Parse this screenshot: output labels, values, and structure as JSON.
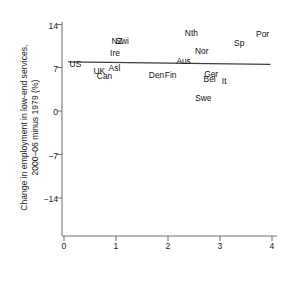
{
  "chart_data": {
    "type": "scatter",
    "title": "",
    "xlabel": "Employment protection, 1982–2003 (index)",
    "ylabel": "Change in employment in low-end services,\n2000–06 minus 1979 (%)",
    "xlim": [
      0,
      4
    ],
    "ylim": [
      -14,
      14
    ],
    "xticks": [
      "0",
      "1",
      "2",
      "3",
      "4"
    ],
    "yticks": [
      "14",
      "7",
      "0",
      "−7",
      "−14"
    ],
    "grid": false,
    "legend": "none",
    "marker_style": "text-label-only",
    "points": [
      {
        "label": "US",
        "x": 0.22,
        "y": 7.6
      },
      {
        "label": "UK",
        "x": 0.68,
        "y": 6.5
      },
      {
        "label": "Can",
        "x": 0.78,
        "y": 5.6
      },
      {
        "label": "Asl",
        "x": 0.97,
        "y": 7.0
      },
      {
        "label": "Ire",
        "x": 0.98,
        "y": 9.4
      },
      {
        "label": "NZ",
        "x": 1.02,
        "y": 11.2
      },
      {
        "label": "Swi",
        "x": 1.12,
        "y": 11.2
      },
      {
        "label": "Den",
        "x": 1.78,
        "y": 5.8
      },
      {
        "label": "Fin",
        "x": 2.05,
        "y": 5.8
      },
      {
        "label": "Aus",
        "x": 2.3,
        "y": 8.1
      },
      {
        "label": "Nth",
        "x": 2.45,
        "y": 12.6
      },
      {
        "label": "Nor",
        "x": 2.65,
        "y": 9.7
      },
      {
        "label": "Swe",
        "x": 2.68,
        "y": 2.1
      },
      {
        "label": "Ger",
        "x": 2.83,
        "y": 5.9
      },
      {
        "label": "Bel",
        "x": 2.8,
        "y": 5.1
      },
      {
        "label": "It",
        "x": 3.08,
        "y": 4.8
      },
      {
        "label": "Sp",
        "x": 3.37,
        "y": 11.0
      },
      {
        "label": "Por",
        "x": 3.82,
        "y": 12.4
      }
    ],
    "fit_line": {
      "name": "linear fit",
      "x0": 0.08,
      "y0": 7.9,
      "x1": 3.97,
      "y1": 7.5,
      "color": "#3d3d3d"
    },
    "axis_color": "#6e6e6e"
  }
}
